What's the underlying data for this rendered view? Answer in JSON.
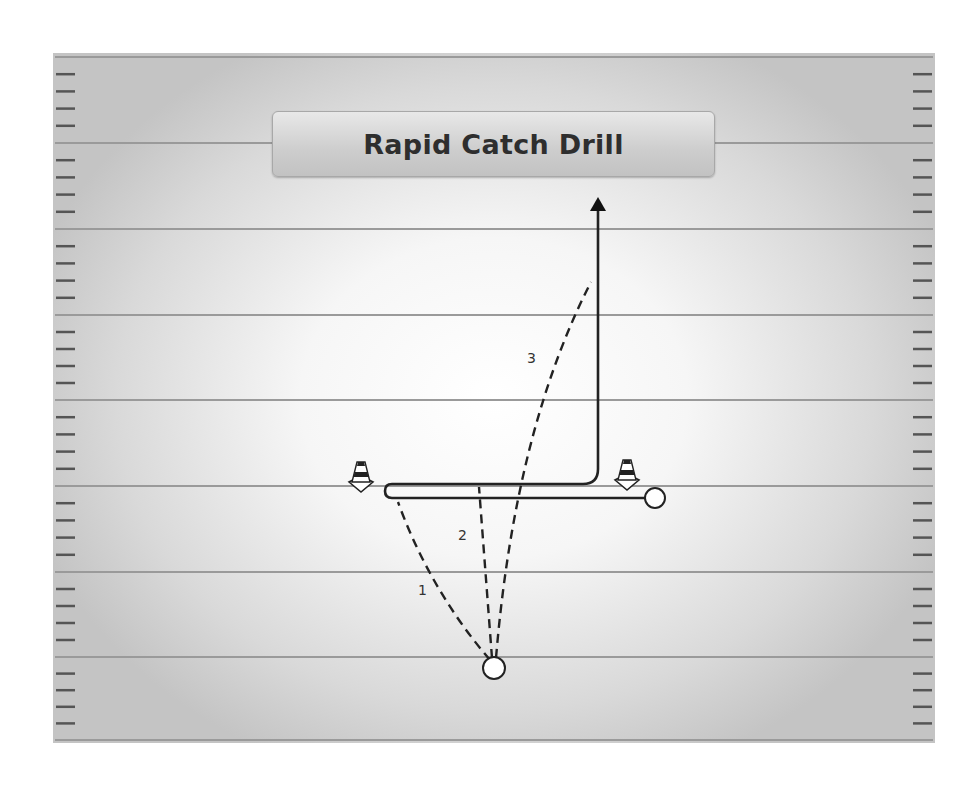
{
  "title": "Rapid Catch Drill",
  "colors": {
    "field_center": "#ffffff",
    "field_edge": "#c4c4c4",
    "yard_line": "#9a9a9a",
    "hash_mark": "#555555",
    "route": "#222222",
    "title_box": "#cdcdcd"
  },
  "field": {
    "yard_lines_y": [
      57,
      143,
      229,
      315,
      400,
      486,
      572,
      657,
      740
    ],
    "hash_marks_per_gap": 4
  },
  "cones": [
    {
      "name": "cone-left",
      "x": 361,
      "y": 478
    },
    {
      "name": "cone-right",
      "x": 627,
      "y": 476
    }
  ],
  "players": [
    {
      "name": "receiver",
      "x": 655,
      "y": 498,
      "r": 10
    },
    {
      "name": "quarterback",
      "x": 494,
      "y": 668,
      "r": 11
    }
  ],
  "throws": [
    {
      "label": "1",
      "label_x": 418,
      "label_y": 595
    },
    {
      "label": "2",
      "label_x": 458,
      "label_y": 540
    },
    {
      "label": "3",
      "label_x": 527,
      "label_y": 363
    }
  ]
}
